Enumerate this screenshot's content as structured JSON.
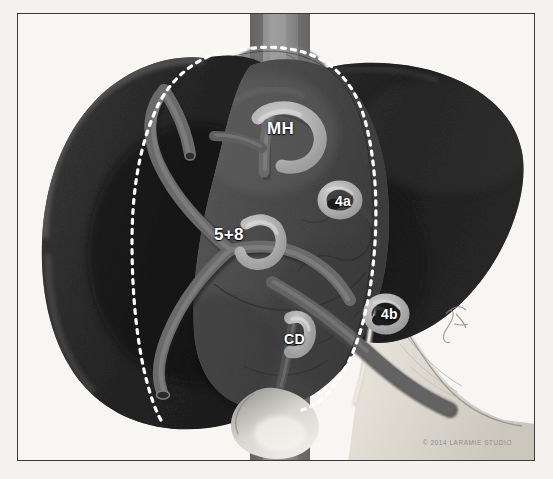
{
  "figure": {
    "kind": "medical-illustration",
    "background_color": "#f4f2ee",
    "frame_color": "#3b3b3b",
    "inner_color": "#f7f6f2"
  },
  "labels": {
    "middle_hepatic_vein": "MH",
    "segment_5_8_branch": "5+8",
    "segment_4a": "4a",
    "segment_4b": "4b",
    "cystic_duct": "CD"
  },
  "anatomy": {
    "left_lobe_color": "#2b2b2b",
    "right_lobe_color": "#1f1f1f",
    "central_lobe_color": "#4e4e4e",
    "vena_cava_color": "#8a8a8a",
    "vessel_color": "#5e5e5e",
    "clip_color": "#b9b9b9",
    "ligament_color": "#e8e5de",
    "gallbladder_color": "#c8c6bf",
    "resection_line_color": "#ffffff"
  },
  "credit": {
    "text": "© 2014 LARAMIE STUDIO"
  }
}
